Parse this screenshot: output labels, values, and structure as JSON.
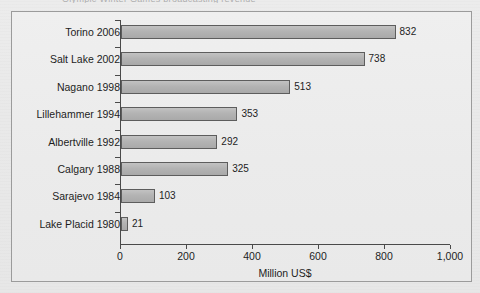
{
  "page": {
    "cropped_title_fragment": "Olympic Winter Games broadcasting revenue"
  },
  "chart_data": {
    "type": "bar",
    "orientation": "horizontal",
    "title": "",
    "xlabel": "Million US$",
    "ylabel": "",
    "xlim": [
      0,
      1000
    ],
    "grid": false,
    "legend": null,
    "categories": [
      "Torino 2006",
      "Salt Lake 2002",
      "Nagano 1998",
      "Lillehammer 1994",
      "Albertville 1992",
      "Calgary 1988",
      "Sarajevo 1984",
      "Lake Placid 1980"
    ],
    "values": [
      832,
      738,
      513,
      353,
      292,
      325,
      103,
      21
    ],
    "value_labels": [
      "832",
      "738",
      "513",
      "353",
      "292",
      "325",
      "103",
      "21"
    ],
    "xticks": [
      0,
      200,
      400,
      600,
      800,
      1000
    ],
    "xtick_labels": [
      "0",
      "200",
      "400",
      "600",
      "800",
      "1,000"
    ],
    "colors": {
      "bar_fill": "#b3b3b3",
      "bar_border": "#5d5d5d",
      "axis": "#4a4a4a",
      "text": "#1d1d1d",
      "plot_background": "#ebebeb",
      "frame_border": "#9b9b9b"
    }
  }
}
